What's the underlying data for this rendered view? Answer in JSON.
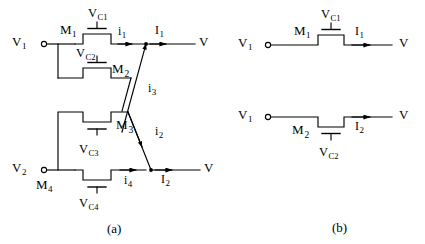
{
  "figure": {
    "caption_a": "(a)",
    "caption_b": "(b)",
    "stroke_color": "#000000",
    "background_color": "#ffffff"
  },
  "panel_a": {
    "terminals": {
      "v1_label": "V",
      "v1_sub": "1",
      "v2_label": "V",
      "v2_sub": "2",
      "out_top_label": "V",
      "out_bottom_label": "V"
    },
    "devices": [
      {
        "name": "M",
        "sub": "1",
        "gate_voltage": "V",
        "gate_voltage_sub": "C1"
      },
      {
        "name": "M",
        "sub": "2",
        "gate_voltage": "V",
        "gate_voltage_sub": "C2"
      },
      {
        "name": "M",
        "sub": "3",
        "gate_voltage": "V",
        "gate_voltage_sub": "C3"
      },
      {
        "name": "M",
        "sub": "4",
        "gate_voltage": "V",
        "gate_voltage_sub": "C4"
      }
    ],
    "currents": [
      {
        "symbol": "i",
        "sub": "1"
      },
      {
        "symbol": "I",
        "sub": "1"
      },
      {
        "symbol": "i",
        "sub": "3"
      },
      {
        "symbol": "i",
        "sub": "2"
      },
      {
        "symbol": "i",
        "sub": "4"
      },
      {
        "symbol": "I",
        "sub": "2"
      }
    ]
  },
  "panel_b": {
    "branch_top": {
      "in_label": "V",
      "in_sub": "1",
      "device": "M",
      "device_sub": "1",
      "gate_voltage": "V",
      "gate_voltage_sub": "C1",
      "current": "I",
      "current_sub": "1",
      "out_label": "V"
    },
    "branch_bottom": {
      "in_label": "V",
      "in_sub": "1",
      "device": "M",
      "device_sub": "2",
      "gate_voltage": "V",
      "gate_voltage_sub": "C2",
      "current": "I",
      "current_sub": "2",
      "out_label": "V"
    }
  }
}
